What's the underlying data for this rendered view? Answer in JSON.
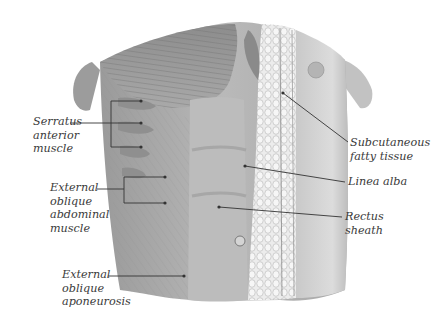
{
  "diagram": {
    "labels": [
      {
        "id": "serratus",
        "lines": [
          "Serratus",
          "anterior",
          "muscle"
        ]
      },
      {
        "id": "ext-oblique-muscle",
        "lines": [
          "External",
          "oblique",
          "abdominal",
          "muscle"
        ]
      },
      {
        "id": "ext-oblique-aponeurosis",
        "lines": [
          "External",
          "oblique",
          "aponeurosis"
        ]
      },
      {
        "id": "subcutaneous",
        "lines": [
          "Subcutaneous",
          "fatty tissue"
        ]
      },
      {
        "id": "linea-alba",
        "lines": [
          "Linea alba"
        ]
      },
      {
        "id": "rectus-sheath",
        "lines": [
          "Rectus",
          "sheath"
        ]
      }
    ],
    "colors": {
      "muscle_dark": "#7a7a7a",
      "muscle_mid": "#a0a0a0",
      "muscle_light": "#c8c8c8",
      "skin": "#d6d6d6",
      "fat": "#e9e9e9",
      "leader": "#333333"
    }
  }
}
